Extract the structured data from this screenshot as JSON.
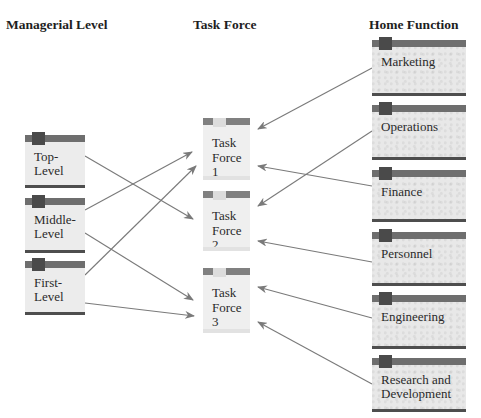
{
  "headers": {
    "managerial": "Managerial Level",
    "task_force": "Task Force",
    "home_function": "Home Function"
  },
  "managerial_levels": [
    {
      "id": "top",
      "label_lines": [
        "Top-",
        "Level"
      ]
    },
    {
      "id": "middle",
      "label_lines": [
        "Middle-",
        "Level"
      ]
    },
    {
      "id": "first",
      "label_lines": [
        "First-",
        "Level"
      ]
    }
  ],
  "task_forces": [
    {
      "id": "tf1",
      "label_lines": [
        "Task",
        "Force",
        "1"
      ]
    },
    {
      "id": "tf2",
      "label_lines": [
        "Task",
        "Force",
        "2"
      ]
    },
    {
      "id": "tf3",
      "label_lines": [
        "Task",
        "Force",
        "3"
      ]
    }
  ],
  "home_functions": [
    {
      "id": "marketing",
      "label_lines": [
        "Marketing"
      ]
    },
    {
      "id": "operations",
      "label_lines": [
        "Operations"
      ]
    },
    {
      "id": "finance",
      "label_lines": [
        "Finance"
      ]
    },
    {
      "id": "personnel",
      "label_lines": [
        "Personnel"
      ]
    },
    {
      "id": "engineering",
      "label_lines": [
        "Engineering"
      ]
    },
    {
      "id": "rnd",
      "label_lines": [
        "Research and",
        "Development"
      ]
    }
  ],
  "connections": [
    {
      "from": "top",
      "to": "tf2"
    },
    {
      "from": "middle",
      "to": "tf1"
    },
    {
      "from": "middle",
      "to": "tf3"
    },
    {
      "from": "first",
      "to": "tf1"
    },
    {
      "from": "first",
      "to": "tf3"
    },
    {
      "from": "marketing",
      "to": "tf1"
    },
    {
      "from": "operations",
      "to": "tf2"
    },
    {
      "from": "finance",
      "to": "tf1"
    },
    {
      "from": "personnel",
      "to": "tf2"
    },
    {
      "from": "engineering",
      "to": "tf3"
    },
    {
      "from": "rnd",
      "to": "tf3"
    }
  ],
  "colors": {
    "arrow": "#7a7a7a",
    "bar": "#6e6e6e",
    "tab": "#4a4a4a",
    "box": "#ececec"
  }
}
